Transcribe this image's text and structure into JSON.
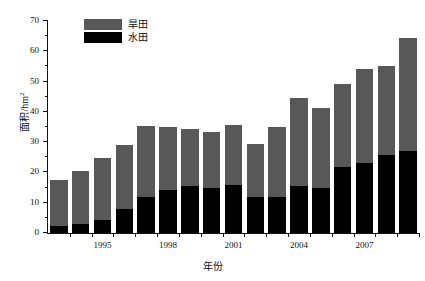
{
  "chart_data": {
    "type": "bar",
    "subtype": "stacked-bar",
    "title": "",
    "xlabel": "年份",
    "ylabel": "面积/hm2",
    "ylabel_display": "面积/hm",
    "ylabel_superscript": "2",
    "ylim": [
      0,
      70
    ],
    "ytick_step": 10,
    "yminor_step": 5,
    "ytick_labels": [
      "0",
      "10",
      "20",
      "30",
      "40",
      "50",
      "60",
      "70"
    ],
    "grid": false,
    "legend_position": "top-left-inside",
    "categories": [
      1993,
      1994,
      1995,
      1996,
      1997,
      1998,
      1999,
      2000,
      2001,
      2002,
      2003,
      2004,
      2005,
      2006,
      2007,
      2008,
      2009
    ],
    "xtick_labels": [
      "1995",
      "1998",
      "2001",
      "2004",
      "2007"
    ],
    "xtick_values": [
      1995,
      1998,
      2001,
      2004,
      2007
    ],
    "series": [
      {
        "name": "水田",
        "color": "#000000",
        "values": [
          2.3,
          3.0,
          4.3,
          7.8,
          12.0,
          14.3,
          15.5,
          15.0,
          16.0,
          11.8,
          12.0,
          15.5,
          15.0,
          21.7,
          23.0,
          25.7,
          27.0
        ]
      },
      {
        "name": "旱田",
        "color": "#585858",
        "values": [
          15.2,
          17.4,
          20.6,
          21.4,
          23.3,
          20.7,
          18.8,
          18.3,
          19.8,
          17.5,
          22.9,
          29.0,
          26.2,
          27.5,
          31.0,
          29.4,
          37.5
        ]
      }
    ],
    "totals": [
      17.5,
      20.4,
      24.9,
      29.2,
      35.3,
      35.0,
      34.3,
      33.3,
      35.8,
      29.3,
      34.9,
      44.5,
      41.2,
      49.2,
      54.0,
      55.1,
      64.5
    ],
    "annotations": []
  },
  "legend": {
    "items": [
      {
        "label": "旱田",
        "color": "#585858",
        "swatch_name": "legend-swatch-dry-field"
      },
      {
        "label": "水田",
        "color": "#000000",
        "swatch_name": "legend-swatch-paddy-field"
      }
    ]
  },
  "axes": {
    "y_title": "面积/hm",
    "y_title_sup": "2",
    "x_title": "年份"
  }
}
